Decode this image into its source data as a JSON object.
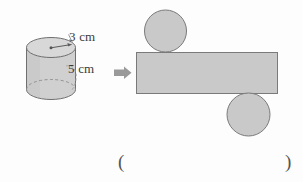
{
  "exercise": {
    "left_figure": {
      "shape_name": "cylinder",
      "labels": {
        "radius": "3 cm",
        "height": "5 cm"
      }
    },
    "transform_arrow": {
      "icon": "arrow-right-icon",
      "color": "#9a9a9a"
    },
    "right_figure": {
      "shape_name": "cylinder-net",
      "parts": [
        {
          "name": "top-circle",
          "shape": "circle"
        },
        {
          "name": "lateral-rectangle",
          "shape": "rectangle"
        },
        {
          "name": "bottom-circle",
          "shape": "circle"
        }
      ]
    },
    "answer_blank": {
      "open_paren": "(",
      "close_paren": ")"
    },
    "colors": {
      "fill": "#c9c9c9",
      "stroke": "#7a7a7a",
      "text": "#3a3a3a",
      "background": "#fdfdfd"
    }
  }
}
